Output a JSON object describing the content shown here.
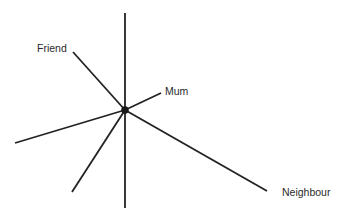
{
  "diagram": {
    "type": "sociogram / star network",
    "center": {
      "x": 125,
      "y": 110,
      "r": 3.5
    },
    "stroke_color": "#222222",
    "stroke_width": 1.8,
    "vertical_axis": {
      "x1": 125,
      "y1": 13,
      "x2": 125,
      "y2": 208
    },
    "rays": [
      {
        "name": "friend",
        "label": "Friend",
        "x2": 73,
        "y2": 52
      },
      {
        "name": "mum",
        "label": "Mum",
        "x2": 161,
        "y2": 93
      },
      {
        "name": "neighbour",
        "label": "Neighbour",
        "x2": 267,
        "y2": 191
      },
      {
        "name": "unlabeled-left",
        "label": "",
        "x2": 15,
        "y2": 143
      },
      {
        "name": "unlabeled-lower",
        "label": "",
        "x2": 72,
        "y2": 192
      }
    ]
  },
  "labels": {
    "friend": "Friend",
    "mum": "Mum",
    "neighbour": "Neighbour"
  }
}
